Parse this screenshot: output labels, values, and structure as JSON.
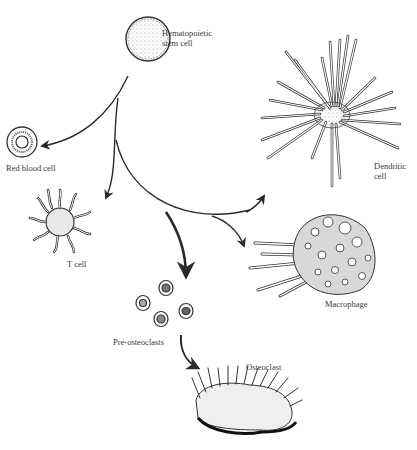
{
  "colors": {
    "ink": "#2a2a2a",
    "label": "#3a3a3a",
    "background": "#ffffff"
  },
  "nodes": {
    "stem_cell": {
      "label": "Hematopoietic\nstem cell"
    },
    "red_blood_cell": {
      "label": "Red blood cell"
    },
    "t_cell": {
      "label": "T cell"
    },
    "dendritic_cell": {
      "label": "Dendritic\ncell"
    },
    "macrophage": {
      "label": "Macrophage"
    },
    "pre_osteoclasts": {
      "label": "Pre-osteoclasts"
    },
    "osteoclast": {
      "label": "Osteoclast"
    }
  },
  "edges": [
    {
      "from": "stem_cell",
      "to": "red_blood_cell"
    },
    {
      "from": "stem_cell",
      "to": "t_cell"
    },
    {
      "from": "stem_cell",
      "to": "dendritic_cell"
    },
    {
      "from": "stem_cell",
      "to": "macrophage"
    },
    {
      "from": "stem_cell",
      "to": "pre_osteoclasts"
    },
    {
      "from": "pre_osteoclasts",
      "to": "osteoclast"
    }
  ]
}
